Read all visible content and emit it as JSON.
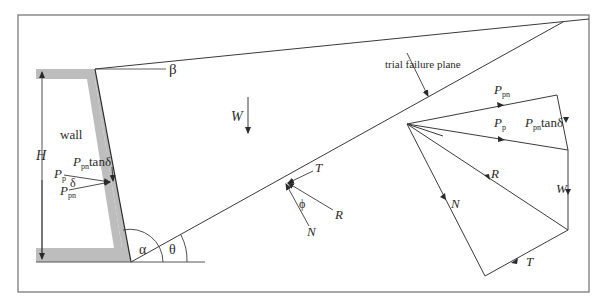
{
  "figure": {
    "colors": {
      "line": "#3a3a3a",
      "wall_fill": "#bdbdbd",
      "frame": "#6e6e6e",
      "background": "#ffffff"
    },
    "labels": {
      "wall": "wall",
      "beta": "β",
      "height": "H",
      "weight": "W",
      "alpha": "α",
      "theta": "θ",
      "phi": "ϕ",
      "delta": "δ",
      "normal": "N",
      "resultant": "R",
      "tangential": "T",
      "trial_plane": "trial failure plane",
      "pp_main": "P",
      "pp_sub": "p",
      "ppn_main": "P",
      "ppn_sub": "pn",
      "tan_delta": "tanδ"
    },
    "force_polygon": {
      "ppn": "P",
      "ppn_sub": "pn",
      "pp": "P",
      "pp_sub": "p",
      "ppn_tan_main": "P",
      "ppn_tan_sub": "pn",
      "ppn_tan_rest": "tanδ",
      "R": "R",
      "W": "W",
      "N": "N",
      "T": "T"
    }
  }
}
